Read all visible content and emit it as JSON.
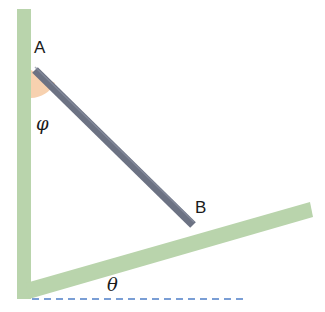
{
  "diagram": {
    "title": "",
    "labels": {
      "point_a": "A",
      "point_b": "B",
      "angle_phi": "φ",
      "angle_theta": "θ"
    },
    "elements": {
      "wall": "vertical wall",
      "incline": "inclined plane",
      "rod": "rod AB",
      "phi_sector": "angle between wall and rod",
      "horizontal_reference": "dashed horizontal line"
    },
    "colors": {
      "wall": "#b9d4ac",
      "incline": "#b9d4ac",
      "rod": "#6c7283",
      "rod_edge": "#8a90a2",
      "phi_sector": "#f6c9a1",
      "dashed_line": "#4f7fc8",
      "text": "#1a1a1a"
    }
  }
}
